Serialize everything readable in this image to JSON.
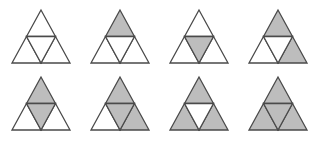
{
  "diagram": {
    "colors": {
      "fill_shaded": "#bdbdbd",
      "fill_empty": "#ffffff",
      "stroke": "#4a4a4a"
    },
    "geometry": {
      "half_width": 29,
      "height": 53
    },
    "figures": [
      {
        "id": 1,
        "row": 1,
        "cx": 41,
        "apex_y": 10,
        "shaded": []
      },
      {
        "id": 2,
        "row": 1,
        "cx": 120,
        "apex_y": 10,
        "shaded": [
          "top"
        ]
      },
      {
        "id": 3,
        "row": 1,
        "cx": 199,
        "apex_y": 10,
        "shaded": [
          "center"
        ]
      },
      {
        "id": 4,
        "row": 1,
        "cx": 278,
        "apex_y": 10,
        "shaded": [
          "top",
          "right"
        ]
      },
      {
        "id": 5,
        "row": 2,
        "cx": 41,
        "apex_y": 77,
        "shaded": [
          "top",
          "center"
        ]
      },
      {
        "id": 6,
        "row": 2,
        "cx": 120,
        "apex_y": 77,
        "shaded": [
          "top",
          "center",
          "right"
        ]
      },
      {
        "id": 7,
        "row": 2,
        "cx": 199,
        "apex_y": 77,
        "shaded": [
          "top",
          "left",
          "right"
        ]
      },
      {
        "id": 8,
        "row": 2,
        "cx": 278,
        "apex_y": 77,
        "shaded": [
          "top",
          "left",
          "center",
          "right"
        ]
      }
    ]
  }
}
